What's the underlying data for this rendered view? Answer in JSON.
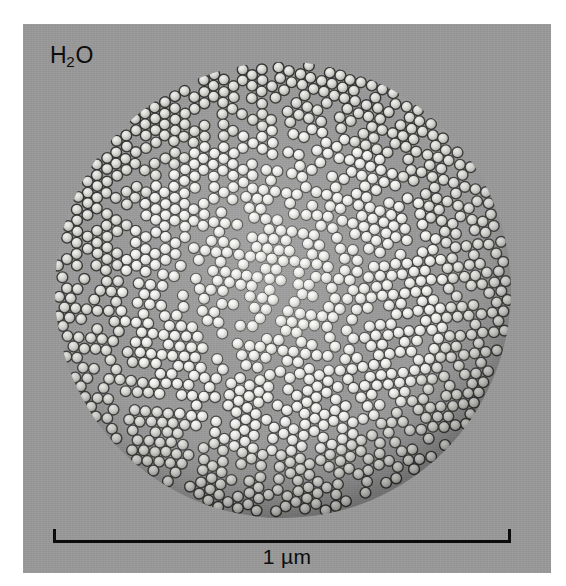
{
  "figure": {
    "panel_background_color": "#9a9a9a",
    "page_background_color": "#ffffff",
    "ink_color": "#0c0c0c"
  },
  "specimen": {
    "label_prefix": "H",
    "label_subscript": "2",
    "label_suffix": "O",
    "label_full": "H2O"
  },
  "scale_bar": {
    "label": "1 µm",
    "value": 1,
    "unit": "µm",
    "bar_left_px": 53,
    "bar_right_px": 511,
    "bar_y_px": 536,
    "cap_style": "upward-ticks"
  },
  "chart_data": {
    "type": "scatter",
    "title": "",
    "subtitle": "",
    "xlabel": "",
    "ylabel": "",
    "annotations": [
      "H2O",
      "1 µm"
    ],
    "legend": [],
    "grid": false,
    "aggregate": {
      "shape": "circle",
      "center_x_px": 283,
      "center_y_px": 290,
      "radius_px": 228,
      "diameter_px": 456,
      "diameter_um": 1.0
    },
    "particles": {
      "packing": "hexagonal-close-packed",
      "sphere_diameter_px": 11.2,
      "sphere_diameter_nm": 24,
      "approximate_count": 1650,
      "fill_color_center": "#f2f2f0",
      "fill_color_edge": "#a8a8a4",
      "outline_color": "#2c2c2c",
      "grain_domains": 7
    },
    "calibration": {
      "scale_bar_length_px": 458,
      "scale_bar_length_um": 1,
      "px_per_um": 458
    }
  }
}
